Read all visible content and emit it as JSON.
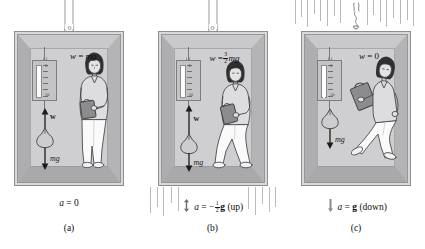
{
  "figure": {
    "colors": {
      "frame": "#d9d9da",
      "wall": "#b9b9bb",
      "back_wall": "#cfcfd1",
      "ink": "#101010",
      "cable": "#9a9a9d",
      "streak": "#bcbcbf"
    }
  },
  "scale": {
    "top_label": "0",
    "bottom_label": "50",
    "tick_count": 6
  },
  "panels": [
    {
      "letter": "(a)",
      "weight_eq": {
        "w": "w",
        "eq": "=",
        "rhs": "mg",
        "fraction": null
      },
      "vector_up_label": "w",
      "vector_down_label": "mg",
      "show_up_vector": true,
      "caption": {
        "a": "a",
        "eq": "=",
        "value": "0",
        "fraction": null,
        "direction": ""
      },
      "cable_state": "intact",
      "motion_lines": false,
      "pose": "standing",
      "scale_reading": "mg"
    },
    {
      "letter": "(b)",
      "weight_eq": {
        "w": "w",
        "eq": "=",
        "rhs": "mg",
        "fraction": {
          "num": "3",
          "den": "2"
        }
      },
      "vector_up_label": "w",
      "vector_down_label": "mg",
      "show_up_vector": true,
      "caption": {
        "a": "a",
        "eq": "= −",
        "value": "g",
        "fraction": {
          "num": "1",
          "den": "2"
        },
        "direction": "(up)"
      },
      "cable_state": "intact",
      "motion_lines": true,
      "pose": "crouched",
      "scale_reading": "1.5mg"
    },
    {
      "letter": "(c)",
      "weight_eq": {
        "w": "w",
        "eq": "=",
        "rhs": "0",
        "fraction": null
      },
      "vector_up_label": "",
      "vector_down_label": "mg",
      "show_up_vector": false,
      "caption": {
        "a": "a",
        "eq": "=",
        "value": "g",
        "fraction": null,
        "direction": "(down)"
      },
      "cable_state": "broken",
      "motion_lines": true,
      "pose": "floating",
      "scale_reading": "0"
    }
  ]
}
